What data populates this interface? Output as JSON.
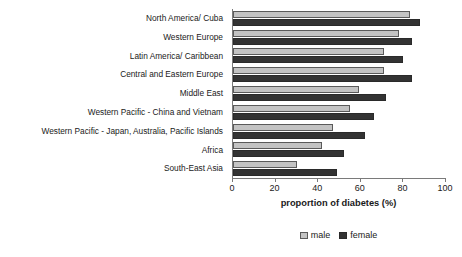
{
  "chart_data": {
    "type": "bar",
    "orientation": "horizontal",
    "title": "",
    "xlabel": "proportion of diabetes (%)",
    "ylabel": "",
    "xlim": [
      0,
      100
    ],
    "xticks": [
      0,
      20,
      40,
      60,
      80,
      100
    ],
    "grid": false,
    "legend_position": "bottom-center",
    "categories": [
      "North America/ Cuba",
      "Western Europe",
      "Latin America/ Caribbean",
      "Central and Eastern Europe",
      "Middle East",
      "Western Pacific - China and Vietnam",
      "Western Pacific - Japan, Australia, Pacific Islands",
      "Africa",
      "South-East Asia"
    ],
    "series": [
      {
        "name": "male",
        "color": "#c3c3c3",
        "values": [
          83,
          78,
          71,
          71,
          59,
          55,
          47,
          42,
          30
        ]
      },
      {
        "name": "female",
        "color": "#333333",
        "values": [
          88,
          84,
          80,
          84,
          72,
          66,
          62,
          52,
          49
        ]
      }
    ]
  },
  "axis": {
    "tick_labels": [
      "0",
      "20",
      "40",
      "60",
      "80",
      "100"
    ],
    "x_title": "proportion of diabetes (%)"
  },
  "legend": {
    "items": [
      {
        "label": "male"
      },
      {
        "label": "female"
      }
    ]
  }
}
